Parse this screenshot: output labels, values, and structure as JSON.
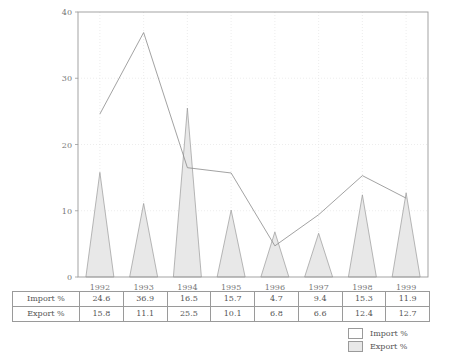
{
  "chart_data": {
    "type": "line",
    "title": "",
    "xlabel": "",
    "ylabel": "",
    "categories": [
      "1992",
      "1993",
      "1994",
      "1995",
      "1996",
      "1997",
      "1998",
      "1999"
    ],
    "series": [
      {
        "name": "Import %",
        "style": "line",
        "color": "#8a8a8a",
        "fill": "#ffffff",
        "values": [
          24.6,
          36.9,
          16.5,
          15.7,
          4.7,
          9.4,
          15.3,
          11.9
        ]
      },
      {
        "name": "Export %",
        "style": "peak-area",
        "color": "#9a9a9a",
        "fill": "#e8e8e8",
        "values": [
          15.8,
          11.1,
          25.5,
          10.1,
          6.8,
          6.6,
          12.4,
          12.7
        ]
      }
    ],
    "ylim": [
      0,
      40
    ],
    "yticks": [
      0,
      10,
      20,
      30,
      40
    ],
    "ytick_labels": [
      "0",
      "10",
      "20",
      "30",
      "40"
    ],
    "grid": true,
    "legend_position": "bottom-right"
  },
  "table": {
    "rows": [
      {
        "label": "Import %",
        "values": [
          "24.6",
          "36.9",
          "16.5",
          "15.7",
          "4.7",
          "9.4",
          "15.3",
          "11.9"
        ]
      },
      {
        "label": "Export %",
        "values": [
          "15.8",
          "11.1",
          "25.5",
          "10.1",
          "6.8",
          "6.6",
          "12.4",
          "12.7"
        ]
      }
    ]
  },
  "legend": {
    "items": [
      {
        "label": "Import %",
        "swatch": "#ffffff"
      },
      {
        "label": "Export %",
        "swatch": "#e8e8e8"
      }
    ]
  }
}
